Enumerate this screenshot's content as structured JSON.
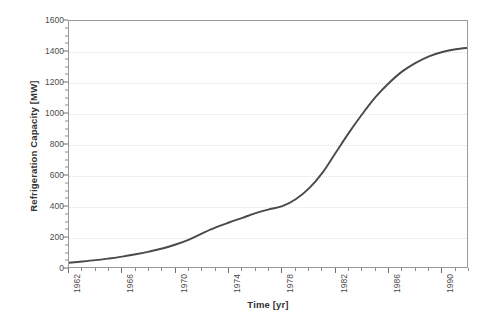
{
  "chart_data": {
    "type": "line",
    "title": "",
    "xlabel": "Time [yr]",
    "ylabel": "Refrigeration Capacity [MW]",
    "xlim": [
      1962,
      1992
    ],
    "ylim": [
      0,
      1600
    ],
    "grid": "horizontal",
    "legend_position": "none",
    "line_color": "#4a4a4a",
    "xticks_major": [
      1962,
      1966,
      1970,
      1974,
      1978,
      1982,
      1986,
      1990
    ],
    "xtick_labels": [
      "1962",
      "1966",
      "1970",
      "1974",
      "1978",
      "1982",
      "1986",
      "1990"
    ],
    "xtick_minor_step": 1,
    "yticks_major": [
      0,
      200,
      400,
      600,
      800,
      1000,
      1200,
      1400,
      1600
    ],
    "ytick_labels": [
      "0",
      "200",
      "400",
      "600",
      "800",
      "1000",
      "1200",
      "1400",
      "1600"
    ],
    "ytick_minor_step": 50,
    "series": [
      {
        "name": "Refrigeration Capacity",
        "x": [
          1962,
          1963,
          1964,
          1965,
          1966,
          1967,
          1968,
          1969,
          1970,
          1971,
          1972,
          1973,
          1974,
          1975,
          1976,
          1977,
          1978,
          1979,
          1980,
          1981,
          1982,
          1983,
          1984,
          1985,
          1986,
          1987,
          1988,
          1989,
          1990,
          1991,
          1992
        ],
        "values": [
          40,
          48,
          57,
          68,
          80,
          95,
          112,
          132,
          158,
          190,
          230,
          268,
          300,
          330,
          360,
          385,
          405,
          450,
          520,
          620,
          750,
          880,
          1000,
          1110,
          1200,
          1275,
          1330,
          1372,
          1400,
          1418,
          1428
        ]
      }
    ]
  },
  "axis_titles": {
    "y": "Refrigeration Capacity [MW]",
    "x": "Time [yr]"
  }
}
